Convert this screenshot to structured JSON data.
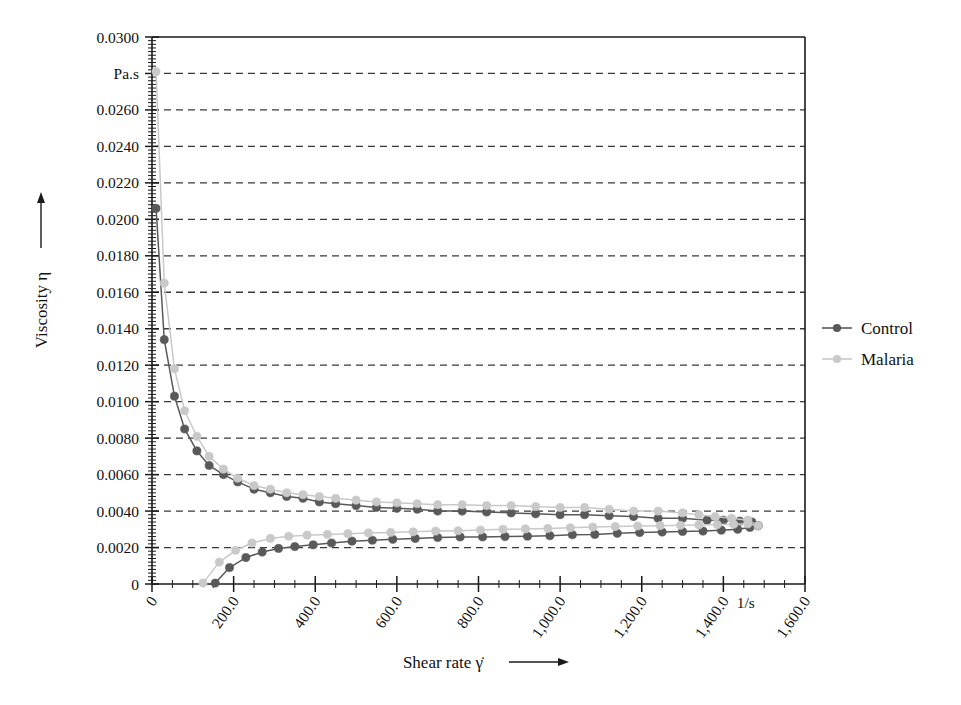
{
  "chart_data": {
    "type": "line",
    "title": "",
    "subtitle": "",
    "xlabel": "Shear rate γ̇",
    "ylabel": "Viscosity η",
    "x_unit": "1/s",
    "y_unit": "Pa.s",
    "xlim": [
      0,
      1600
    ],
    "ylim": [
      0,
      0.03
    ],
    "grid": true,
    "grid_style": "dashed-horizontal",
    "legend_position": "right",
    "x_tick_labels": [
      "0",
      "200.0",
      "400.0",
      "600.0",
      "800.0",
      "1,000.0",
      "1,200.0",
      "1,400.0",
      "1,600.0"
    ],
    "x_tick_values": [
      0,
      200,
      400,
      600,
      800,
      1000,
      1200,
      1400,
      1600
    ],
    "y_tick_labels": [
      "0",
      "0.0020",
      "0.0040",
      "0.0060",
      "0.0080",
      "0.0100",
      "0.0120",
      "0.0140",
      "0.0160",
      "0.0180",
      "0.0200",
      "0.0220",
      "0.0240",
      "0.0260",
      "Pa.s",
      "0.0300"
    ],
    "y_tick_values": [
      0,
      0.002,
      0.004,
      0.006,
      0.008,
      0.01,
      0.012,
      0.014,
      0.016,
      0.018,
      0.02,
      0.022,
      0.024,
      0.026,
      0.028,
      0.03
    ],
    "legend": [
      {
        "name": "Control",
        "color": "#595959"
      },
      {
        "name": "Malaria",
        "color": "#c9c9c9"
      }
    ],
    "series": [
      {
        "name": "Control",
        "branch": "down-ramp",
        "color": "#595959",
        "marker": "circle",
        "x": [
          10,
          30,
          55,
          80,
          110,
          140,
          175,
          210,
          250,
          290,
          330,
          370,
          410,
          450,
          500,
          550,
          600,
          650,
          700,
          760,
          820,
          880,
          940,
          1000,
          1060,
          1120,
          1180,
          1240,
          1300,
          1360,
          1400,
          1440,
          1470,
          1485
        ],
        "y": [
          0.0206,
          0.0134,
          0.0103,
          0.0085,
          0.0073,
          0.0065,
          0.006,
          0.0056,
          0.0052,
          0.005,
          0.0048,
          0.0047,
          0.0045,
          0.0044,
          0.0043,
          0.0042,
          0.00415,
          0.0041,
          0.004,
          0.004,
          0.00395,
          0.0039,
          0.00385,
          0.0038,
          0.0038,
          0.00375,
          0.0037,
          0.0036,
          0.0036,
          0.0035,
          0.0035,
          0.00345,
          0.0034,
          0.0032
        ]
      },
      {
        "name": "Malaria",
        "branch": "down-ramp",
        "color": "#c9c9c9",
        "marker": "circle",
        "x": [
          10,
          30,
          55,
          80,
          110,
          140,
          175,
          210,
          250,
          290,
          330,
          370,
          410,
          450,
          500,
          550,
          600,
          650,
          700,
          760,
          820,
          880,
          940,
          1000,
          1060,
          1120,
          1180,
          1240,
          1300,
          1340,
          1380,
          1420,
          1460,
          1485
        ],
        "y": [
          0.0281,
          0.0165,
          0.0118,
          0.0095,
          0.0081,
          0.007,
          0.0063,
          0.0058,
          0.0054,
          0.0052,
          0.005,
          0.0049,
          0.0048,
          0.0047,
          0.0046,
          0.0045,
          0.00445,
          0.0044,
          0.00435,
          0.00435,
          0.0043,
          0.0043,
          0.00425,
          0.0042,
          0.0042,
          0.0041,
          0.004,
          0.004,
          0.0039,
          0.0038,
          0.0037,
          0.0036,
          0.0035,
          0.0032
        ]
      },
      {
        "name": "Control",
        "branch": "up-ramp",
        "color": "#595959",
        "marker": "circle",
        "x": [
          155,
          190,
          230,
          270,
          310,
          350,
          395,
          440,
          490,
          540,
          590,
          645,
          700,
          755,
          810,
          865,
          920,
          975,
          1030,
          1085,
          1140,
          1195,
          1250,
          1300,
          1350,
          1395,
          1435,
          1465,
          1485
        ],
        "y": [
          5e-05,
          0.0009,
          0.00145,
          0.00175,
          0.00195,
          0.00205,
          0.00215,
          0.00225,
          0.00235,
          0.0024,
          0.00245,
          0.0025,
          0.00255,
          0.00258,
          0.00258,
          0.0026,
          0.00262,
          0.00265,
          0.0027,
          0.00272,
          0.00278,
          0.00282,
          0.00285,
          0.00288,
          0.0029,
          0.00295,
          0.003,
          0.0031,
          0.0032
        ]
      },
      {
        "name": "Malaria",
        "branch": "up-ramp",
        "color": "#c9c9c9",
        "marker": "circle",
        "x": [
          125,
          165,
          205,
          245,
          290,
          335,
          380,
          430,
          480,
          530,
          585,
          640,
          695,
          750,
          805,
          860,
          915,
          970,
          1025,
          1080,
          1135,
          1190,
          1245,
          1295,
          1340,
          1385,
          1425,
          1460,
          1485
        ],
        "y": [
          5e-05,
          0.0012,
          0.00185,
          0.00225,
          0.0025,
          0.00262,
          0.00268,
          0.00272,
          0.00276,
          0.0028,
          0.00283,
          0.00286,
          0.0029,
          0.00292,
          0.00296,
          0.003,
          0.00302,
          0.00305,
          0.00308,
          0.00312,
          0.00315,
          0.00318,
          0.0032,
          0.00322,
          0.00324,
          0.00326,
          0.00328,
          0.0033,
          0.0032
        ]
      }
    ]
  },
  "axes": {
    "y_arrow_title": "Viscosity η",
    "x_arrow_title": "Shear rate γ̇",
    "x_unit_marker": "1/s",
    "y_unit_marker": "Pa.s"
  },
  "colors": {
    "control": "#595959",
    "malaria": "#c9c9c9",
    "axis": "#1a1a1a",
    "grid": "#3a3a3a",
    "background": "#ffffff"
  }
}
